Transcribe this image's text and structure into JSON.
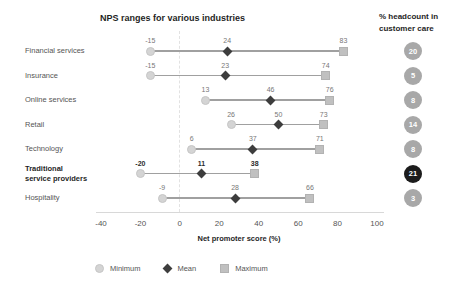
{
  "chart_data": {
    "type": "scatter",
    "subtype": "dumbbell-range",
    "title": "NPS ranges for various industries",
    "xlabel": "Net promoter score (%)",
    "xlim": [
      -40,
      100
    ],
    "xticks": [
      "-40",
      "-20",
      "0",
      "20",
      "40",
      "60",
      "80",
      "100"
    ],
    "grid": "single dashed vertical line at 0",
    "legend_position": "bottom",
    "categories": [
      "Financial services",
      "Insurance",
      "Online services",
      "Retail",
      "Technology",
      "Traditional service providers",
      "Hospitality"
    ],
    "category_label_lines": [
      [
        "Financial services"
      ],
      [
        "Insurance"
      ],
      [
        "Online services"
      ],
      [
        "Retail"
      ],
      [
        "Technology"
      ],
      [
        "Traditional",
        "service providers"
      ],
      [
        "Hospitality"
      ]
    ],
    "highlighted_category_index": 5,
    "series": [
      {
        "name": "Minimum",
        "marker": "circle",
        "values": [
          -15,
          -15,
          13,
          26,
          6,
          -20,
          -9
        ]
      },
      {
        "name": "Mean",
        "marker": "diamond",
        "values": [
          24,
          23,
          46,
          50,
          37,
          11,
          28
        ]
      },
      {
        "name": "Maximum",
        "marker": "square",
        "values": [
          83,
          74,
          76,
          73,
          71,
          38,
          66
        ]
      }
    ],
    "headcount": {
      "header_line1": "% headcount in",
      "header_line2": "customer care",
      "values": [
        "20",
        "5",
        "8",
        "14",
        "8",
        "21",
        "3"
      ],
      "highlighted_index": 5
    },
    "legend": [
      {
        "label": "Minimum",
        "marker": "circle"
      },
      {
        "label": "Mean",
        "marker": "diamond"
      },
      {
        "label": "Maximum",
        "marker": "square"
      }
    ],
    "colors": {
      "minimum_fill": "#d4d4d4",
      "mean_fill": "#3d3d3d",
      "maximum_fill": "#c0c0c0",
      "range_line": "#a0a0a0",
      "badge_bg": "#a8a8a8",
      "badge_highlight_bg": "#1c1c1c",
      "badge_text": "#ffffff",
      "title_text": "#1f1f1f",
      "label_text": "#555555",
      "value_text": "#777777",
      "axis_line": "#d8d8d8",
      "zero_dash": "#e2e2e2",
      "background": "#ffffff"
    }
  }
}
